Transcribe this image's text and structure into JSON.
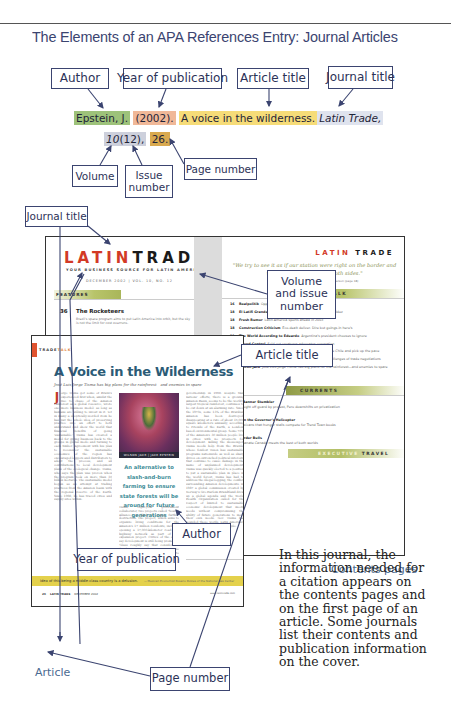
{
  "page_title": "The Elements of an APA References Entry: Journal Articles",
  "citation": {
    "author": "Epstein, J.",
    "year": "(2002).",
    "article_title": "A voice in the wilderness.",
    "journal_title": "Latin Trade,",
    "volume": "10",
    "issue": "(12),",
    "page": "26."
  },
  "labels": {
    "author": "Author",
    "year": "Year of publication",
    "article_title": "Article title",
    "journal_title": "Journal title",
    "volume": "Volume",
    "issue": "Issue number",
    "page_number": "Page number",
    "journal_title_2": "Journal title",
    "volume_issue": "Volume and issue number",
    "article_title_2": "Article title",
    "author_2": "Author",
    "year_2": "Year of publication",
    "page_number_2": "Page number"
  },
  "contents_page": {
    "logo_red": "LATIN",
    "logo_black": "TRADE",
    "tagline": "YOUR BUSINESS SOURCE FOR LATIN AMERICA",
    "date_line": "DECEMBER 2002 | VOL. 10, NO. 12",
    "features_label": "FEATURES",
    "feature": {
      "num": "36",
      "title": "The Rocketeers",
      "desc": "Brazil's space program aims to put Latin America into orbit, but the sky is not the limit for cost overruns."
    },
    "right_logo_red": "LATIN",
    "right_logo_black": "TRADE",
    "quote": "\"We try to see it as if our station were right on the border and we were transmitting to both sides.\"",
    "quote_attrib": "— Lorraine, Chief Financial Officer Ricardo Anderson (page 18)",
    "trade_talk_label": "TRADE TALK",
    "trade_talk": [
      {
        "n": "16",
        "t": "Realpolitik",
        "d": "Opposition take reality TV to Congress"
      },
      {
        "n": "18",
        "t": "El Latifi Grande",
        "d": "Look out Starbucks, here comes Juan Valdez"
      },
      {
        "n": "18",
        "t": "Fresh Rumor",
        "d": "Latin America sports ahead in 2003"
      },
      {
        "n": "18",
        "t": "Construction Criticism",
        "d": "Eco-dealt deliver. Dire but goings-in here's"
      },
      {
        "n": "19",
        "t": "The World According to Eduardo",
        "d": "Argentina's president chooses to ignore"
      },
      {
        "n": "20",
        "t": "Crowd Control",
        "d": "Sold out creatures advocates coronation"
      },
      {
        "n": "20",
        "t": "Big Bank Watch",
        "d": "Bancos fold first ways on top Banco de Chile and pick up the pace"
      },
      {
        "n": "22",
        "t": "Q&A",
        "d": "Chinese President Ricardo Lagos discusses the challenges of trade negotiations"
      },
      {
        "n": "26",
        "t": "Silicon Jack",
        "d": "Jose Luis Jorge Tisma has big plans for the rainforest—and enemies to spare"
      }
    ],
    "currents_label": "CURRENTS",
    "currents": [
      {
        "n": "28",
        "t": "A Banner Stumbler",
        "d": "Caught off guard by protest, Peru downshifts on privatization"
      },
      {
        "n": "30",
        "t": "Can the Governor's Helicopter",
        "d": "Mexicans that hunger stalls compete for Trend Town books"
      },
      {
        "n": "32",
        "t": "Border Bulls",
        "d": "Cipanate Canada meets the best of both worlds"
      }
    ],
    "exec_label": "EXECUTIVE",
    "travel_label": "TRAVEL"
  },
  "article_page": {
    "section_a": "TRADE",
    "section_b": "TALK",
    "headline": "A Voice in the Wilderness",
    "deck": "José Luis Jorge Tisma has big plans for the rainforest—and enemies to spare",
    "dropcap": "J",
    "col1_text": "orge Tisma got some of Brazil's experienced first when, amidst the rise to chase of the Amazon rainforest as a global resource, wrote one more business model: as long as humans are willing to invest in it. Yet in many a skeptically-worded item he has put the whole idea of preserving practice into an effort to both understand and show the world that financial benefits of going 'sustainable.' Tisma has created a model for giving business back to the groups in global mode and turning to each timber. Agreement with his plan to reconsider the sustainable economics of the region has encouraged loggers and distributors to adopt the process, and all contributions to local development plans of the ecological change. Tisma, who says the plan was proven when the program took on more than 30 billion hectares. The sustainable model began as an attempt at trading practices from the Amazon basin with the regional reserve of the Earth. Since 1998, he has traced cities and supply sites within.",
    "photo_caption": "WILSON JACK | JACK EPSTEIN",
    "pullquote": "An alternative to slash-and-burn farming to ensure state forests will be around for future generations",
    "col2b_text": "Tisma, eight-year government collaborator, two projects called 'Search Alliance,' is likely to cause further destruction. The project, which aims to organize living conditions for the Amazon's 17 million residents, includes opening a 17,000-kilometer road and highway network as part of the expansion project. Critics of the effort say development is still being promoted. 'Glass roughly say that considerable development in the interior is one problem' Tisma will not soon offer to resolve.",
    "col3_text": "governorship in 1998. Despite that nations' efforts, there is a growing Amazon Basin, seems to be the world's largest tropical rainforest, continues to be cut down at an alarming rate. Since the 1970s, some 13% of the Brazilian Amazon has been destroyed, disappearing at a rate of about 15,000 square kilometers annually, according to Friends of the Earth, a London-based environmental group. Some 70% of the Amazon's 30 million people live in cities with no prospects for development. Killing the messenger: Tisma needs help from the Brazils, whose fondest vision has sustainable programs nationwide as well as sharp drives on entrenched political interests that continue to cause damage in the name of unplanned development. Tisma was quickly elected to a position to put a sustainable plan in place in the world forest. Tisma has had to address the illegal logging, the conflict surrounding Amazon developments. In 1987 a global commission created by Norway's Gro Harlem Brundtland drew up a global agenda and the World Health Organization called for the respect of limited to sustainable economic development that meets needs without compromising the ability of future generations to meet their own needs. Gov. Tisma has sounded those words. Latin America's leaders should follow his example.",
    "band_text": "Idea of this being a middle-class country is a delusion.",
    "band_tail": "— Mexican Economist Rosario Robles of the National Gas Center",
    "footer_page": "26",
    "footer_journal": "LATIN TRADE",
    "footer_date": "DECEMBER 2002",
    "footer_url": "www.latintrade.com"
  },
  "captions": {
    "article": "Article",
    "contents": "Contents pages"
  },
  "side_note": "In this journal, the information needed for a citation appears on the contents pages and on the first page of an article. Some journals list their contents and publication information on the cover.",
  "colors": {
    "label_border": "#3b4470",
    "author_highlight": "#9dc27a",
    "year_highlight": "#f0b898",
    "title_highlight": "#f6dc78",
    "journal_highlight": "#dfe3ee",
    "volume_highlight": "#cdd0dc",
    "page_highlight": "#d9a94e",
    "logo_red": "#d23a26",
    "headline_teal": "#2b5b76",
    "band_yellow": "#e4d14c"
  }
}
